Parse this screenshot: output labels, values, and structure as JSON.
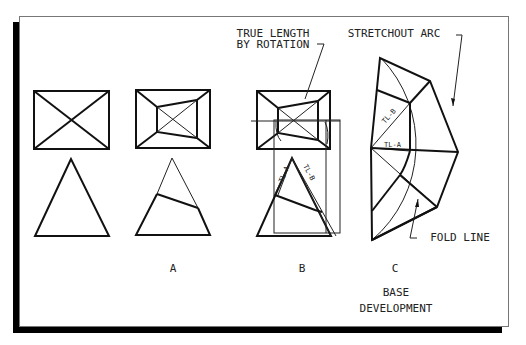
{
  "figure": {
    "labels": {
      "true_length": [
        "TRUE LENGTH",
        "BY ROTATION"
      ],
      "stretchout_arc": "STRETCHOUT ARC",
      "fold_line": "FOLD LINE",
      "view_a": "A",
      "view_b": "B",
      "view_c": "C",
      "base_development": [
        "BASE",
        "DEVELOPMENT"
      ],
      "tl_a": "TL-A",
      "tl_b": "TL-B"
    },
    "views": [
      {
        "id": "pyramid-plain",
        "description": "Rectangular pyramid: top view with diagonals, front view triangle"
      },
      {
        "id": "A",
        "description": "Truncated pyramid: top view with inner cut polygon, front view with oblique cut line"
      },
      {
        "id": "B",
        "description": "True length by rotation of edges TL-A and TL-B"
      },
      {
        "id": "C",
        "description": "Radial line development with stretchout arc and fold lines"
      }
    ],
    "colors": {
      "line": "#111111",
      "frame": "#777777",
      "shadow": "#000000",
      "background": "#ffffff"
    }
  }
}
